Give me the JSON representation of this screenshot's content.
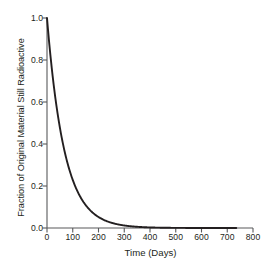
{
  "chart_data": {
    "type": "line",
    "title": "",
    "xlabel": "Time (Days)",
    "ylabel": "Fraction of Original Material Still Radioactive",
    "xlim": [
      0,
      800
    ],
    "ylim": [
      0.0,
      1.0
    ],
    "xticks": [
      0,
      100,
      200,
      300,
      400,
      500,
      600,
      700,
      800
    ],
    "xtick_labels": [
      "0",
      "100",
      "200",
      "300",
      "400",
      "500",
      "600",
      "700",
      "800"
    ],
    "yticks": [
      0.0,
      0.2,
      0.4,
      0.6,
      0.8,
      1.0
    ],
    "ytick_labels": [
      "0.0",
      "0.2",
      "0.4",
      "0.6",
      "0.8",
      "1.0"
    ],
    "grid": false,
    "legend": null,
    "series": [
      {
        "name": "Fraction remaining",
        "model": "exponential decay",
        "half_life_days": 47,
        "x": [
          0,
          25,
          50,
          75,
          100,
          125,
          150,
          175,
          200,
          225,
          250,
          275,
          300,
          325,
          350,
          375,
          400,
          425,
          450,
          475,
          500,
          525,
          550,
          575,
          600,
          625,
          650,
          675,
          700,
          725,
          735
        ],
        "y": [
          1.0,
          0.69,
          0.48,
          0.33,
          0.23,
          0.16,
          0.11,
          0.076,
          0.053,
          0.037,
          0.025,
          0.018,
          0.012,
          0.0085,
          0.0059,
          0.0041,
          0.0028,
          0.002,
          0.0014,
          0.00095,
          0.00066,
          0.00046,
          0.00032,
          0.00022,
          0.00015,
          0.00011,
          7e-05,
          5e-05,
          4e-05,
          2e-05,
          2e-05
        ],
        "color": "#231f20",
        "line_width": 1.9
      }
    ],
    "axis_color": "#58595b",
    "background": "#ffffff"
  }
}
